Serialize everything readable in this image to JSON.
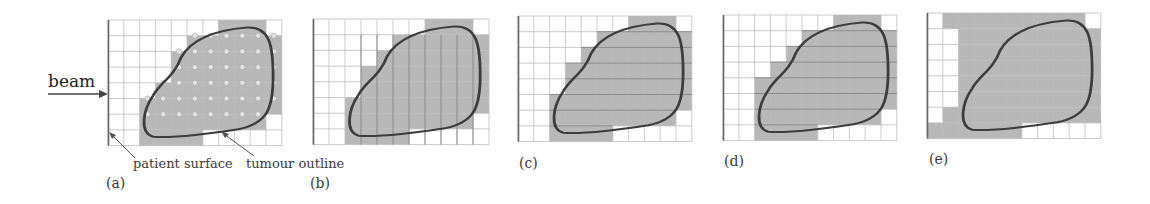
{
  "figure": {
    "beam_label": "beam",
    "annotations": {
      "patient_surface": "patient surface",
      "tumour_outline": "tumour outline"
    },
    "colors": {
      "grid_line": "#bdbdbd",
      "cell_fill": "#b8b8b8",
      "outline": "#3c3c3c",
      "spot": "#e4e4e4"
    },
    "panels": [
      {
        "id": "a",
        "label": "(a)",
        "left": 108,
        "top": 20,
        "cols": 11,
        "rows": 8,
        "cw": 15.8,
        "ch": 15.7,
        "label_pos": [
          106,
          175
        ],
        "shaded": [
          [
            7,
            9
          ],
          [
            5,
            10
          ],
          [
            4,
            10
          ],
          [
            4,
            10
          ],
          [
            3,
            10
          ],
          [
            2,
            10
          ],
          [
            2,
            9
          ],
          [
            2,
            5
          ]
        ],
        "spots": true,
        "style": "spots"
      },
      {
        "id": "b",
        "label": "(b)",
        "left": 313,
        "top": 19,
        "cols": 11,
        "rows": 8,
        "cw": 16.0,
        "ch": 15.7,
        "label_pos": [
          310,
          175
        ],
        "shaded": [
          [
            7,
            9
          ],
          [
            5,
            10
          ],
          [
            4,
            10
          ],
          [
            3,
            10
          ],
          [
            3,
            10
          ],
          [
            2,
            10
          ],
          [
            2,
            9
          ],
          [
            2,
            5
          ]
        ],
        "spots": false,
        "style": "columns"
      },
      {
        "id": "c",
        "label": "(c)",
        "left": 518,
        "top": 16,
        "cols": 11,
        "rows": 8,
        "cw": 15.8,
        "ch": 15.7,
        "label_pos": [
          519,
          155
        ],
        "shaded": [
          [
            7,
            9
          ],
          [
            5,
            10
          ],
          [
            4,
            10
          ],
          [
            3,
            10
          ],
          [
            3,
            10
          ],
          [
            2,
            10
          ],
          [
            2,
            9
          ],
          [
            2,
            5
          ]
        ],
        "spots": false,
        "style": "bricks"
      },
      {
        "id": "d",
        "label": "(d)",
        "left": 723,
        "top": 15,
        "cols": 11,
        "rows": 8,
        "cw": 15.8,
        "ch": 15.7,
        "label_pos": [
          724,
          153
        ],
        "shaded": [
          [
            7,
            9
          ],
          [
            5,
            10
          ],
          [
            4,
            10
          ],
          [
            3,
            10
          ],
          [
            2,
            10
          ],
          [
            2,
            10
          ],
          [
            2,
            9
          ],
          [
            2,
            5
          ]
        ],
        "spots": false,
        "style": "blocks"
      },
      {
        "id": "e",
        "label": "(e)",
        "left": 927,
        "top": 13,
        "cols": 11,
        "rows": 8,
        "cw": 15.8,
        "ch": 15.7,
        "label_pos": [
          929,
          151
        ],
        "shaded": [
          [
            1,
            9
          ],
          [
            2,
            10
          ],
          [
            2,
            10
          ],
          [
            2,
            10
          ],
          [
            2,
            10
          ],
          [
            2,
            10
          ],
          [
            1,
            10
          ],
          [
            0,
            5
          ]
        ],
        "spots": false,
        "style": "solid"
      }
    ]
  }
}
